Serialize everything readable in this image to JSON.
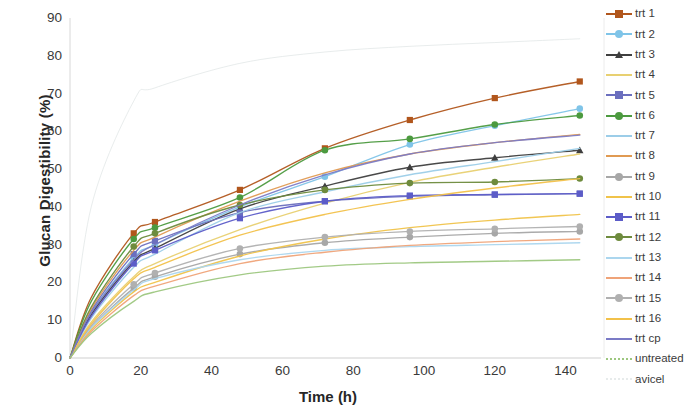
{
  "chart_data": {
    "type": "line",
    "title": "",
    "xlabel": "Time (h)",
    "ylabel": "Glucan Digestibility (%)",
    "xlim": [
      0,
      150
    ],
    "ylim": [
      0,
      90
    ],
    "xticks": [
      0,
      20,
      40,
      60,
      80,
      100,
      120,
      140
    ],
    "yticks": [
      0,
      10,
      20,
      30,
      40,
      50,
      60,
      70,
      80,
      90
    ],
    "grid": false,
    "legend_position": "right",
    "x": [
      0,
      6,
      18,
      24,
      48,
      72,
      96,
      120,
      144
    ],
    "series": [
      {
        "name": "trt 1",
        "color": "#B1561C",
        "marker": "square",
        "values": [
          0,
          16.0,
          33.0,
          36.0,
          44.5,
          55.5,
          63.0,
          68.8,
          73.2
        ]
      },
      {
        "name": "trt 2",
        "color": "#7FC4E8",
        "marker": "circle",
        "values": [
          0,
          12.0,
          26.5,
          30.0,
          40.0,
          48.0,
          56.5,
          61.5,
          66.0
        ]
      },
      {
        "name": "trt 3",
        "color": "#3F3F3F",
        "marker": "triangle",
        "values": [
          0,
          11.5,
          25.5,
          29.0,
          39.5,
          45.5,
          50.5,
          53.0,
          55.0
        ]
      },
      {
        "name": "trt 4",
        "color": "#E8D071",
        "marker": "none",
        "values": [
          0,
          9.5,
          21.5,
          25.0,
          34.0,
          41.0,
          46.5,
          50.5,
          54.0
        ]
      },
      {
        "name": "trt 5",
        "color": "#6B6FBE",
        "marker": "square",
        "values": [
          0,
          12.5,
          27.5,
          31.0,
          38.5,
          41.5,
          42.8,
          43.2,
          43.5
        ]
      },
      {
        "name": "trt 6",
        "color": "#4C9A3F",
        "marker": "circle",
        "values": [
          0,
          15.0,
          31.5,
          34.5,
          42.5,
          55.0,
          58.0,
          61.8,
          64.2
        ]
      },
      {
        "name": "trt 7",
        "color": "#9CCDE8",
        "marker": "none",
        "values": [
          0,
          10.5,
          24.0,
          27.5,
          38.5,
          44.0,
          48.5,
          52.0,
          55.5
        ]
      },
      {
        "name": "trt 8",
        "color": "#E09A52",
        "marker": "none",
        "values": [
          0,
          13.0,
          28.5,
          32.0,
          41.5,
          49.0,
          54.0,
          57.0,
          59.2
        ]
      },
      {
        "name": "trt 9",
        "color": "#A7A7A7",
        "marker": "circle",
        "values": [
          0,
          8.0,
          18.5,
          21.5,
          27.5,
          30.5,
          32.0,
          33.0,
          33.5
        ]
      },
      {
        "name": "trt 10",
        "color": "#F0C34A",
        "marker": "none",
        "values": [
          0,
          7.5,
          17.5,
          20.0,
          27.0,
          31.5,
          34.5,
          36.5,
          38.0
        ]
      },
      {
        "name": "trt 11",
        "color": "#5C5CC8",
        "marker": "square",
        "values": [
          0,
          11.0,
          25.0,
          28.5,
          37.0,
          41.5,
          43.0,
          43.3,
          43.5
        ]
      },
      {
        "name": "trt 12",
        "color": "#6E8B3D",
        "marker": "circle",
        "values": [
          0,
          13.5,
          29.5,
          33.0,
          40.5,
          44.5,
          46.3,
          46.6,
          47.5
        ]
      },
      {
        "name": "trt 13",
        "color": "#ABD6EE",
        "marker": "none",
        "values": [
          0,
          8.0,
          18.0,
          21.0,
          26.0,
          28.5,
          29.5,
          30.0,
          30.5
        ]
      },
      {
        "name": "trt 14",
        "color": "#EFA378",
        "marker": "none",
        "values": [
          0,
          7.0,
          16.5,
          19.0,
          25.0,
          28.0,
          29.8,
          30.8,
          31.5
        ]
      },
      {
        "name": "trt 15",
        "color": "#B0B0B0",
        "marker": "circle",
        "values": [
          0,
          8.5,
          19.5,
          22.5,
          29.0,
          32.0,
          33.5,
          34.2,
          34.8
        ]
      },
      {
        "name": "trt 16",
        "color": "#F2C14A",
        "marker": "none",
        "values": [
          0,
          9.0,
          21.0,
          24.0,
          32.5,
          38.0,
          42.0,
          45.0,
          47.5
        ]
      },
      {
        "name": "trt cp",
        "color": "#7B7BC6",
        "marker": "none",
        "values": [
          0,
          12.0,
          26.0,
          30.0,
          40.5,
          48.5,
          54.0,
          57.0,
          59.0
        ]
      },
      {
        "name": "untreated",
        "color": "#9DC77F",
        "marker": "none",
        "values": [
          0,
          6.5,
          15.0,
          17.5,
          22.0,
          24.3,
          25.2,
          25.6,
          26.0
        ]
      },
      {
        "name": "avicel",
        "color": "#D5DCDC",
        "marker": "none",
        "values": [
          0,
          40.0,
          68.0,
          71.5,
          78.0,
          81.0,
          82.5,
          83.5,
          84.5
        ]
      }
    ]
  },
  "axes": {
    "yticks": [
      "90",
      "80",
      "70",
      "60",
      "50",
      "40",
      "30",
      "20",
      "10",
      "0"
    ],
    "xticks": [
      "0",
      "20",
      "40",
      "60",
      "80",
      "100",
      "120",
      "140"
    ],
    "ylabel": "Glucan Digestibility (%)",
    "xlabel": "Time (h)"
  },
  "legend": {
    "items": [
      {
        "label": "trt 1"
      },
      {
        "label": "trt 2"
      },
      {
        "label": "trt 3"
      },
      {
        "label": "trt 4"
      },
      {
        "label": "trt 5"
      },
      {
        "label": "trt 6"
      },
      {
        "label": "trt 7"
      },
      {
        "label": "trt 8"
      },
      {
        "label": "trt 9"
      },
      {
        "label": "trt 10"
      },
      {
        "label": "trt 11"
      },
      {
        "label": "trt 12"
      },
      {
        "label": "trt 13"
      },
      {
        "label": "trt 14"
      },
      {
        "label": "trt 15"
      },
      {
        "label": "trt 16"
      },
      {
        "label": "trt cp"
      },
      {
        "label": "untreated"
      },
      {
        "label": "avicel"
      }
    ]
  }
}
